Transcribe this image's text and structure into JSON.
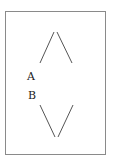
{
  "diagram": {
    "labels": [
      {
        "id": "A",
        "text": "A"
      },
      {
        "id": "B",
        "text": "B"
      }
    ],
    "frame_color": "#8a8a8a",
    "line_color": "#555555"
  }
}
